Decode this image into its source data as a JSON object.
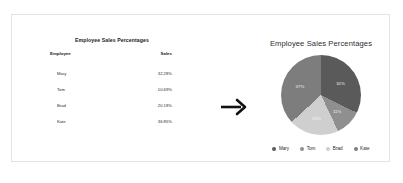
{
  "card": {
    "table": {
      "title": "Employee Sales Percentages",
      "columns": [
        "Employee",
        "Sales"
      ],
      "rows": [
        {
          "employee": "Mary",
          "sales": "32.28%"
        },
        {
          "employee": "Tom",
          "sales": "10.69%"
        },
        {
          "employee": "Brad",
          "sales": "20.18%"
        },
        {
          "employee": "Kate",
          "sales": "36.85%"
        }
      ]
    },
    "arrow": {
      "icon": "arrow-right-icon",
      "color": "#111111"
    }
  },
  "chart_data": {
    "type": "pie",
    "title": "Employee Sales Percentages",
    "categories": [
      "Mary",
      "Tom",
      "Brad",
      "Kate"
    ],
    "values": [
      32.28,
      10.69,
      20.18,
      36.85
    ],
    "value_labels": [
      "32%",
      "11%",
      "20%",
      "37%"
    ],
    "colors": [
      "#5a5a5a",
      "#8f8f8f",
      "#cfcfcf",
      "#7d7d7d"
    ],
    "legend": {
      "position": "bottom",
      "entries": [
        {
          "label": "Mary",
          "color": "#5a5a5a"
        },
        {
          "label": "Tom",
          "color": "#8f8f8f"
        },
        {
          "label": "Brad",
          "color": "#cfcfcf"
        },
        {
          "label": "Kate",
          "color": "#7d7d7d"
        }
      ]
    },
    "grid": false,
    "xlabel": "",
    "ylabel": ""
  }
}
